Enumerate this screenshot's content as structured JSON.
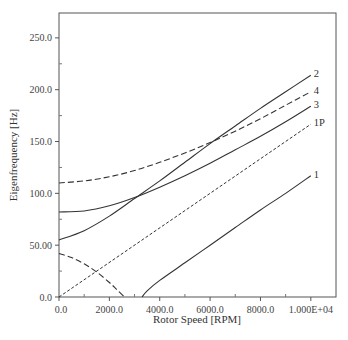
{
  "chart_data": {
    "type": "line",
    "title": "",
    "xlabel": "Rotor Speed [RPM]",
    "ylabel": "Eigenfrequency [Hz]",
    "xlim": [
      0,
      11000
    ],
    "ylim": [
      0,
      274
    ],
    "grid": false,
    "legend": "inline labels at right end of curves",
    "x_ticks": [
      0,
      2000,
      4000,
      6000,
      8000,
      10000
    ],
    "x_tick_labels": [
      "0.0",
      "2000.0",
      "4000.0",
      "6000.0",
      "8000.0",
      "1.000E+04"
    ],
    "y_ticks": [
      0,
      50,
      100,
      150,
      200,
      250
    ],
    "y_tick_labels": [
      "0.0",
      "50.00",
      "100.0",
      "150.0",
      "200.0",
      "250.0"
    ],
    "series": [
      {
        "name": "2",
        "style": "solid",
        "label": "2",
        "x": [
          0,
          1000,
          2000,
          3000,
          4000,
          5000,
          6000,
          7000,
          8000,
          9000,
          10000
        ],
        "y": [
          55,
          64,
          78,
          95,
          112,
          130,
          148,
          165,
          182,
          198,
          214
        ]
      },
      {
        "name": "4",
        "style": "dashed",
        "label": "4",
        "x": [
          0,
          1000,
          2000,
          3000,
          4000,
          5000,
          6000,
          7000,
          8000,
          9000,
          10000
        ],
        "y": [
          110,
          112,
          116,
          122,
          130,
          139,
          149,
          160,
          172,
          185,
          198
        ]
      },
      {
        "name": "3",
        "style": "solid",
        "label": "3",
        "x": [
          0,
          1000,
          2000,
          3000,
          4000,
          5000,
          6000,
          7000,
          8000,
          9000,
          10000
        ],
        "y": [
          82,
          83,
          88,
          96,
          106,
          117,
          129,
          142,
          155,
          169,
          184
        ]
      },
      {
        "name": "1P",
        "style": "dotted",
        "label": "1P",
        "x": [
          0,
          10000
        ],
        "y": [
          0,
          166.7
        ]
      },
      {
        "name": "1",
        "style": "solid",
        "label": "1",
        "x": [
          3300,
          3500,
          4000,
          5000,
          6000,
          7000,
          8000,
          9000,
          10000
        ],
        "y": [
          0,
          6,
          16,
          33,
          50,
          67,
          84,
          100,
          117
        ]
      },
      {
        "name": "backward",
        "style": "dashed",
        "label": "",
        "x": [
          0,
          500,
          1000,
          1500,
          2000,
          2300,
          2600
        ],
        "y": [
          42,
          38,
          32,
          24,
          14,
          7,
          0
        ]
      }
    ]
  }
}
